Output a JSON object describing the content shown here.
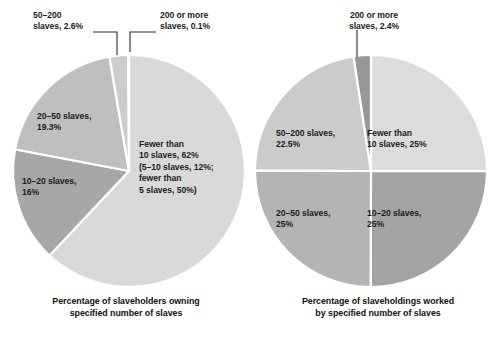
{
  "figure": {
    "background": "#ffffff",
    "text_color": "#1c1c1c"
  },
  "chart_data": [
    {
      "type": "pie",
      "id": "slaveholders-owning",
      "title": "Percentage of slaveholders owning specified number of slaves",
      "start_angle_deg": 0,
      "direction": "clockwise",
      "legend": "none",
      "grid": false,
      "categories": [
        "Fewer than 10 slaves",
        "10–20 slaves",
        "20–50 slaves",
        "50–200 slaves",
        "200 or more slaves"
      ],
      "values": [
        62,
        16,
        19.3,
        2.6,
        0.1
      ],
      "value_labels": [
        "62%",
        "16%",
        "19.3%",
        "2.6%",
        "0.1%"
      ],
      "colors": [
        "#d9d9d9",
        "#a7a7a7",
        "#bfbfbf",
        "#cccccc",
        "#9a9a9a"
      ],
      "sub_breakdown": [
        "5–10 slaves, 12%",
        "fewer than 5 slaves, 50%"
      ],
      "annotations": [
        {
          "label": "50–200 slaves, 2.6%",
          "placement": "callout-top-left"
        },
        {
          "label": "200 or more slaves, 0.1%",
          "placement": "callout-top-right"
        }
      ]
    },
    {
      "type": "pie",
      "id": "slaveholdings-worked",
      "title": "Percentage of slaveholdings worked by specified number of slaves",
      "start_angle_deg": 0,
      "direction": "clockwise",
      "legend": "none",
      "grid": false,
      "categories": [
        "Fewer than 10 slaves",
        "10–20 slaves",
        "20–50 slaves",
        "50–200 slaves",
        "200 or more slaves"
      ],
      "values": [
        25,
        25,
        25,
        22.5,
        2.4
      ],
      "value_labels": [
        "25%",
        "25%",
        "25%",
        "22.5%",
        "2.4%"
      ],
      "colors": [
        "#dcdcdc",
        "#a3a3a3",
        "#b4b4b4",
        "#cbcbcb",
        "#979797"
      ],
      "annotations": [
        {
          "label": "200 or more slaves, 2.4%",
          "placement": "callout-top-center"
        }
      ]
    }
  ],
  "left_chart": {
    "caption": "Percentage of slaveholders owning\nspecified number of slaves",
    "callout_50_200": "50–200\nslaves, 2.6%",
    "callout_200_more": "200 or more\nslaves, 0.1%",
    "label_20_50": "20–50 slaves,\n19.3%",
    "label_10_20": "10–20 slaves,\n16%",
    "label_fewer_than_10": "Fewer than\n10 slaves, 62%\n(5–10 slaves, 12%;\nfewer than\n5 slaves, 50%)"
  },
  "right_chart": {
    "caption": "Percentage of slaveholdings worked\nby specified number of slaves",
    "callout_200_more": "200 or more\nslaves, 2.4%",
    "label_50_200": "50–200 slaves,\n22.5%",
    "label_fewer_than_10": "Fewer than\n10 slaves, 25%",
    "label_20_50": "20–50 slaves,\n25%",
    "label_10_20": "10–20 slaves,\n25%"
  }
}
